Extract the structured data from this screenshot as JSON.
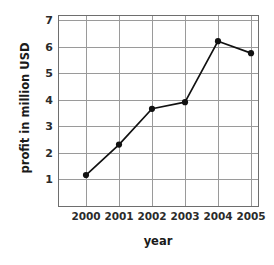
{
  "chart_data": {
    "type": "line",
    "title": "",
    "xlabel": "year",
    "ylabel": "profit in million USD",
    "categories": [
      "2000",
      "2001",
      "2002",
      "2003",
      "2004",
      "2005"
    ],
    "values": [
      1.15,
      2.3,
      3.65,
      3.9,
      6.2,
      5.75
    ],
    "series": [
      {
        "name": "profit",
        "values": [
          1.15,
          2.3,
          3.65,
          3.9,
          6.2,
          5.75
        ]
      }
    ],
    "ylim": [
      0,
      7
    ],
    "y_ticks": [
      "1",
      "2",
      "3",
      "4",
      "5",
      "6",
      "7"
    ],
    "y_tick_values": [
      1,
      2,
      3,
      4,
      5,
      6,
      7
    ],
    "x_ticks": [
      "2000",
      "2001",
      "2002",
      "2003",
      "2004",
      "2005"
    ],
    "grid": true,
    "legend": "none",
    "marker": "filled-circle",
    "colors": {
      "line": "#111111",
      "marker": "#111111",
      "grid": "#9a9a9a",
      "frame": "#6e6e6e",
      "text": "#1a1a1a",
      "background": "#ffffff"
    }
  }
}
